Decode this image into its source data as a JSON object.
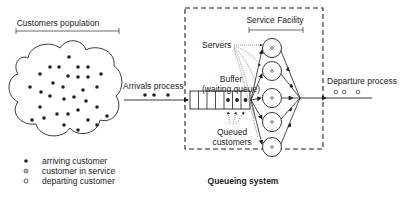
{
  "labels": {
    "population": "Customers population",
    "arrivals": "Arrivals process",
    "buffer_line1": "Buffer",
    "buffer_line2": "(waiting queue)",
    "servers": "Servers",
    "service_facility": "Service Facility",
    "queued_line1": "Queued",
    "queued_line2": "customers",
    "departure": "Departure process",
    "system": "Queueing system"
  },
  "legend": [
    {
      "symbol": "filled-dot",
      "label": "arriving customer"
    },
    {
      "symbol": "dotted-circle",
      "label": "customer in service"
    },
    {
      "symbol": "hollow-circle",
      "label": "departing customer"
    }
  ],
  "buffer": {
    "slots": 7,
    "occupied": 3
  },
  "servers": {
    "count": 5
  },
  "colors": {
    "ink": "#222222",
    "background": "#ffffff"
  }
}
